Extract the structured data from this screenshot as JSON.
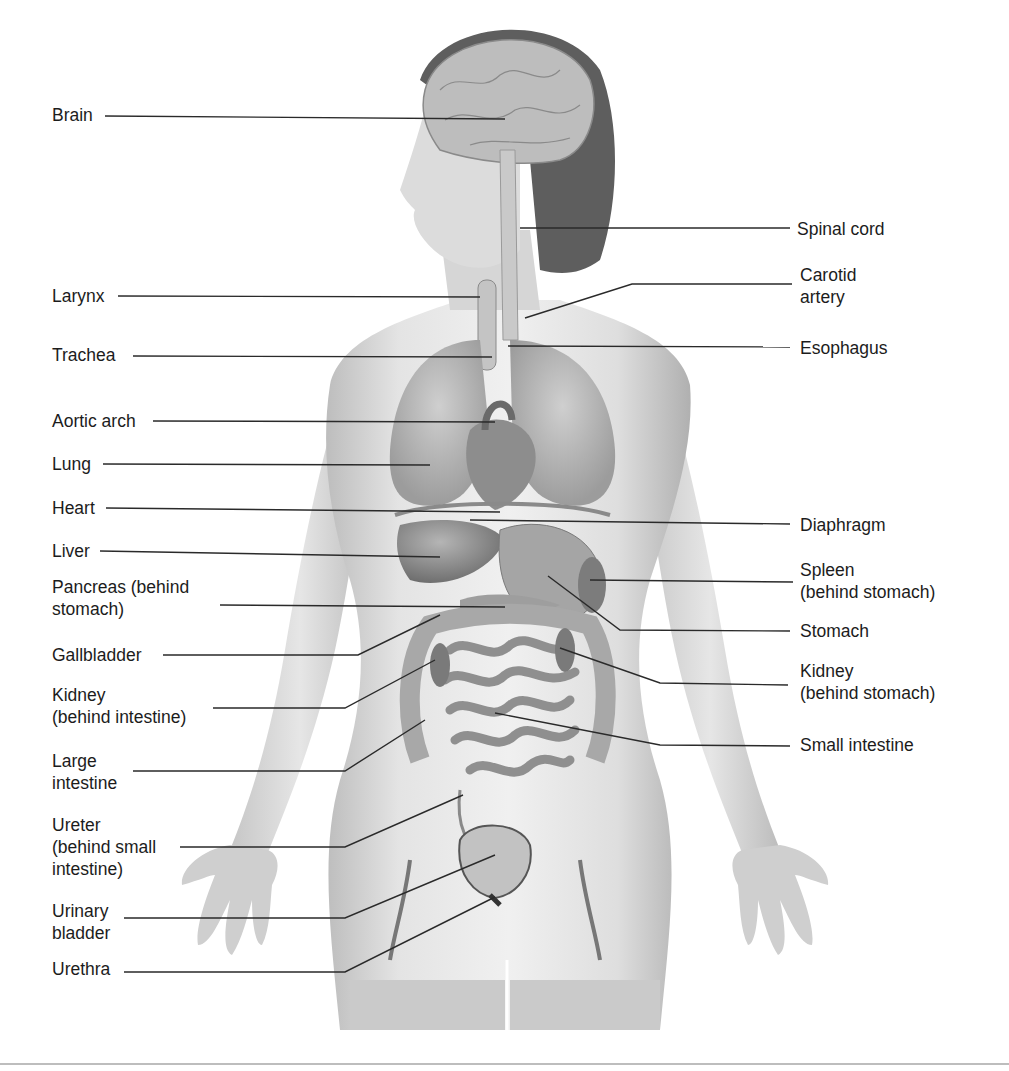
{
  "diagram": {
    "type": "anatomical-illustration",
    "labels_left": [
      {
        "id": "brain",
        "text": "Brain",
        "x": 52,
        "y": 104,
        "line": [
          [
            105,
            116
          ],
          [
            505,
            119
          ]
        ]
      },
      {
        "id": "larynx",
        "text": "Larynx",
        "x": 52,
        "y": 285,
        "line": [
          [
            118,
            296
          ],
          [
            480,
            297
          ]
        ]
      },
      {
        "id": "trachea",
        "text": "Trachea",
        "x": 52,
        "y": 344,
        "line": [
          [
            133,
            356
          ],
          [
            492,
            357
          ]
        ]
      },
      {
        "id": "aortic-arch",
        "text": "Aortic arch",
        "x": 52,
        "y": 410,
        "line": [
          [
            153,
            421
          ],
          [
            495,
            422
          ]
        ]
      },
      {
        "id": "lung",
        "text": "Lung",
        "x": 52,
        "y": 453,
        "line": [
          [
            103,
            464
          ],
          [
            430,
            465
          ]
        ]
      },
      {
        "id": "heart",
        "text": "Heart",
        "x": 52,
        "y": 497,
        "line": [
          [
            106,
            508
          ],
          [
            500,
            512
          ]
        ]
      },
      {
        "id": "liver",
        "text": "Liver",
        "x": 52,
        "y": 540,
        "line": [
          [
            100,
            551
          ],
          [
            440,
            557
          ]
        ]
      },
      {
        "id": "pancreas",
        "text": "Pancreas (behind\nstomach)",
        "x": 52,
        "y": 576,
        "line": [
          [
            220,
            605
          ],
          [
            505,
            607
          ]
        ]
      },
      {
        "id": "gallbladder",
        "text": "Gallbladder",
        "x": 52,
        "y": 644,
        "line": [
          [
            163,
            655
          ],
          [
            358,
            655
          ],
          [
            440,
            615
          ]
        ]
      },
      {
        "id": "kidney-left",
        "text": "Kidney\n(behind intestine)",
        "x": 52,
        "y": 684,
        "line": [
          [
            213,
            708
          ],
          [
            345,
            708
          ],
          [
            435,
            660
          ]
        ]
      },
      {
        "id": "large-intestine",
        "text": "Large\nintestine",
        "x": 52,
        "y": 750,
        "line": [
          [
            133,
            771
          ],
          [
            345,
            771
          ],
          [
            425,
            720
          ]
        ]
      },
      {
        "id": "ureter",
        "text": "Ureter\n(behind small\nintestine)",
        "x": 52,
        "y": 814,
        "line": [
          [
            180,
            847
          ],
          [
            345,
            847
          ],
          [
            463,
            795
          ]
        ]
      },
      {
        "id": "urinary-bladder",
        "text": "Urinary\nbladder",
        "x": 52,
        "y": 900,
        "line": [
          [
            124,
            918
          ],
          [
            345,
            918
          ],
          [
            495,
            855
          ]
        ]
      },
      {
        "id": "urethra",
        "text": "Urethra",
        "x": 52,
        "y": 958,
        "line": [
          [
            124,
            972
          ],
          [
            345,
            972
          ],
          [
            495,
            897
          ]
        ]
      }
    ],
    "labels_right": [
      {
        "id": "spinal-cord",
        "text": "Spinal cord",
        "x": 797,
        "y": 218,
        "line": [
          [
            520,
            228
          ],
          [
            790,
            228
          ]
        ]
      },
      {
        "id": "carotid-artery",
        "text": "Carotid\nartery",
        "x": 800,
        "y": 264,
        "line": [
          [
            525,
            318
          ],
          [
            632,
            284
          ],
          [
            792,
            284
          ]
        ]
      },
      {
        "id": "esophagus",
        "text": "Esophagus",
        "x": 800,
        "y": 337,
        "line": [
          [
            508,
            346
          ],
          [
            790,
            347
          ]
        ]
      },
      {
        "id": "diaphragm",
        "text": "Diaphragm",
        "x": 800,
        "y": 514,
        "line": [
          [
            470,
            520
          ],
          [
            790,
            524
          ]
        ]
      },
      {
        "id": "spleen",
        "text": "Spleen\n(behind stomach)",
        "x": 800,
        "y": 559,
        "line": [
          [
            590,
            580
          ],
          [
            793,
            582
          ]
        ]
      },
      {
        "id": "stomach",
        "text": "Stomach",
        "x": 800,
        "y": 620,
        "line": [
          [
            548,
            576
          ],
          [
            620,
            630
          ],
          [
            790,
            631
          ]
        ]
      },
      {
        "id": "kidney-right",
        "text": "Kidney\n(behind stomach)",
        "x": 800,
        "y": 660,
        "line": [
          [
            560,
            648
          ],
          [
            660,
            683
          ],
          [
            788,
            685
          ]
        ]
      },
      {
        "id": "small-intestine",
        "text": "Small intestine",
        "x": 800,
        "y": 734,
        "line": [
          [
            495,
            713
          ],
          [
            660,
            745
          ],
          [
            790,
            746
          ]
        ]
      }
    ]
  },
  "colors": {
    "text": "#1c1c1c",
    "leader_line": "#2a2a2a",
    "skin": "#d9d9d9",
    "skin_shade": "#b8b8b8",
    "organ": "#9a9a9a",
    "organ_dark": "#6e6e6e",
    "hair": "#5a5a5a",
    "bottom_rule": "#bdbdbd"
  }
}
